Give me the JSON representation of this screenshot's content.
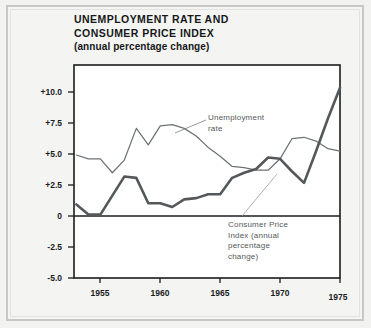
{
  "figure": {
    "title_line_1": "UNEMPLOYMENT RATE AND",
    "title_line_2": "CONSUMER PRICE INDEX",
    "subtitle": "(annual percentage change)"
  },
  "annotations": {
    "unemployment": [
      "Unemployment",
      "rate"
    ],
    "cpi": [
      "Consumer Price",
      "Index (annual",
      "percentage",
      "change)"
    ]
  },
  "colors": {
    "page_background": "#f2f2f0",
    "plot_background": "#ffffff",
    "axis": "#1a1c1e",
    "unemployment_line": "#6e7275",
    "cpi_line": "#55585b",
    "annotation_text": "#55585b",
    "title_text": "#16181a"
  },
  "chart_data": {
    "type": "line",
    "title": "UNEMPLOYMENT RATE AND CONSUMER PRICE INDEX",
    "subtitle": "(annual percentage change)",
    "xlabel": "",
    "ylabel": "",
    "xlim": [
      1952.8,
      1975
    ],
    "ylim": [
      -5.0,
      11.8
    ],
    "grid": false,
    "legend": "annotated-inline",
    "xticks": [
      1955,
      1960,
      1965,
      1970,
      1975
    ],
    "xtick_labels": [
      "1955",
      "1960",
      "1965",
      "1970",
      "1975"
    ],
    "yticks": [
      10.0,
      7.5,
      5.0,
      2.5,
      0,
      -2.5,
      -5.0
    ],
    "ytick_labels": [
      "+10.0",
      "+7.5",
      "+5.0",
      "+2.5",
      "0",
      "-2.5",
      "-5.0"
    ],
    "zero_line": 0,
    "x": [
      1953,
      1954,
      1955,
      1956,
      1957,
      1958,
      1959,
      1960,
      1961,
      1962,
      1963,
      1964,
      1965,
      1966,
      1967,
      1968,
      1969,
      1970,
      1971,
      1972,
      1973,
      1974,
      1975
    ],
    "series": [
      {
        "name": "Unemployment rate",
        "style": "thin",
        "values": [
          4.7,
          4.4,
          4.4,
          3.3,
          4.3,
          6.8,
          5.5,
          7.0,
          7.1,
          6.8,
          6.2,
          5.3,
          4.6,
          3.8,
          3.7,
          3.5,
          3.5,
          4.4,
          6.0,
          6.1,
          5.8,
          5.2,
          5.0
        ]
      },
      {
        "name": "Consumer Price Index (annual percentage change)",
        "style": "thick",
        "values": [
          0.8,
          0.0,
          0.0,
          1.5,
          3.0,
          2.9,
          0.9,
          0.9,
          0.6,
          1.2,
          1.3,
          1.6,
          1.6,
          2.9,
          3.3,
          3.6,
          4.5,
          4.4,
          3.4,
          2.5,
          5.0,
          7.6,
          10.0
        ]
      }
    ]
  }
}
